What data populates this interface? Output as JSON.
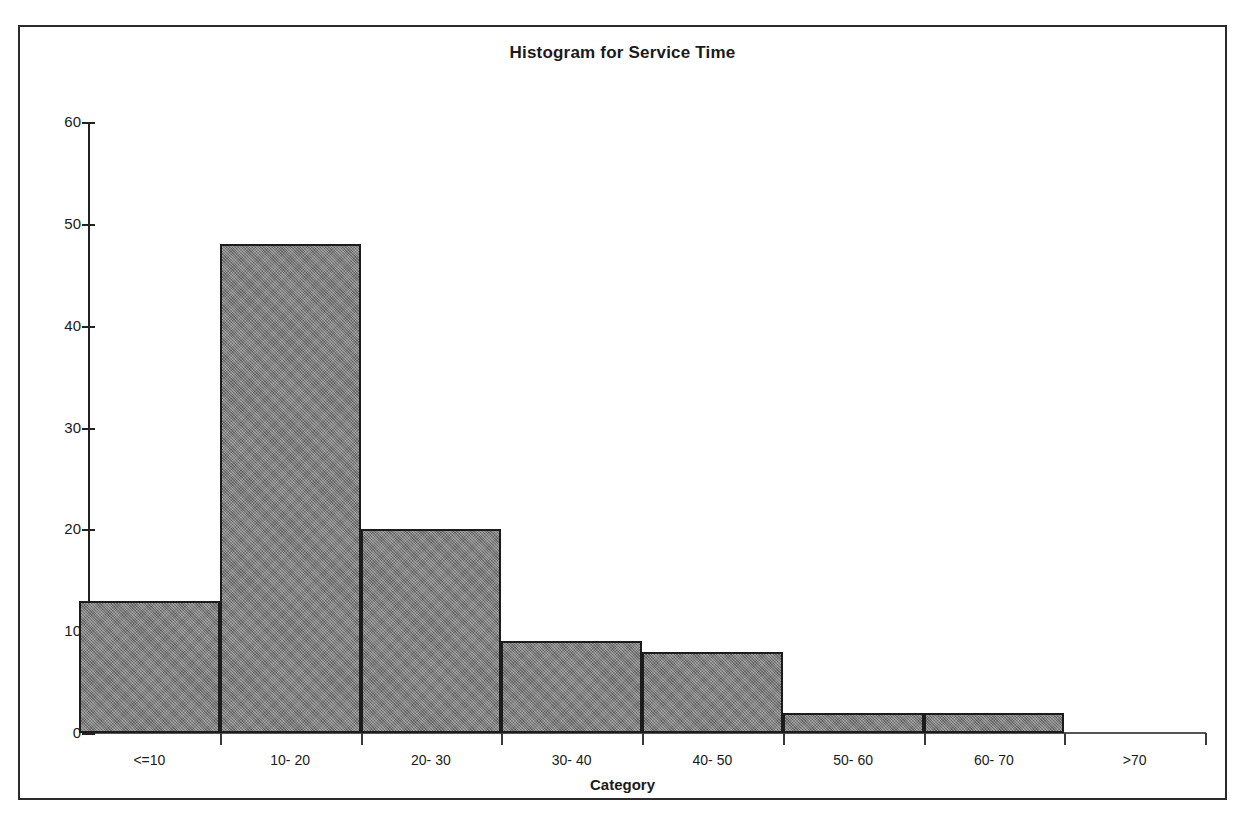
{
  "chart_data": {
    "type": "bar",
    "title": "Histogram for Service Time",
    "xlabel": "Category",
    "ylabel": "",
    "categories": [
      "<=10",
      "10- 20",
      "20- 30",
      "30- 40",
      "40- 50",
      "50- 60",
      "60- 70",
      ">70"
    ],
    "values": [
      13,
      48,
      20,
      9,
      8,
      2,
      2,
      0
    ],
    "ylim": [
      0,
      60
    ],
    "ytick_labels": [
      "0",
      "10",
      "20",
      "30",
      "40",
      "50",
      "60"
    ],
    "ytick_values": [
      0,
      10,
      20,
      30,
      40,
      50,
      60
    ],
    "grid": false,
    "legend": false,
    "bar_fill_color": "#808080",
    "bar_border_color": "#1c1c1c",
    "axis_color": "#222222",
    "frame_color": "#2b2b2b",
    "background_color": "#ffffff"
  }
}
